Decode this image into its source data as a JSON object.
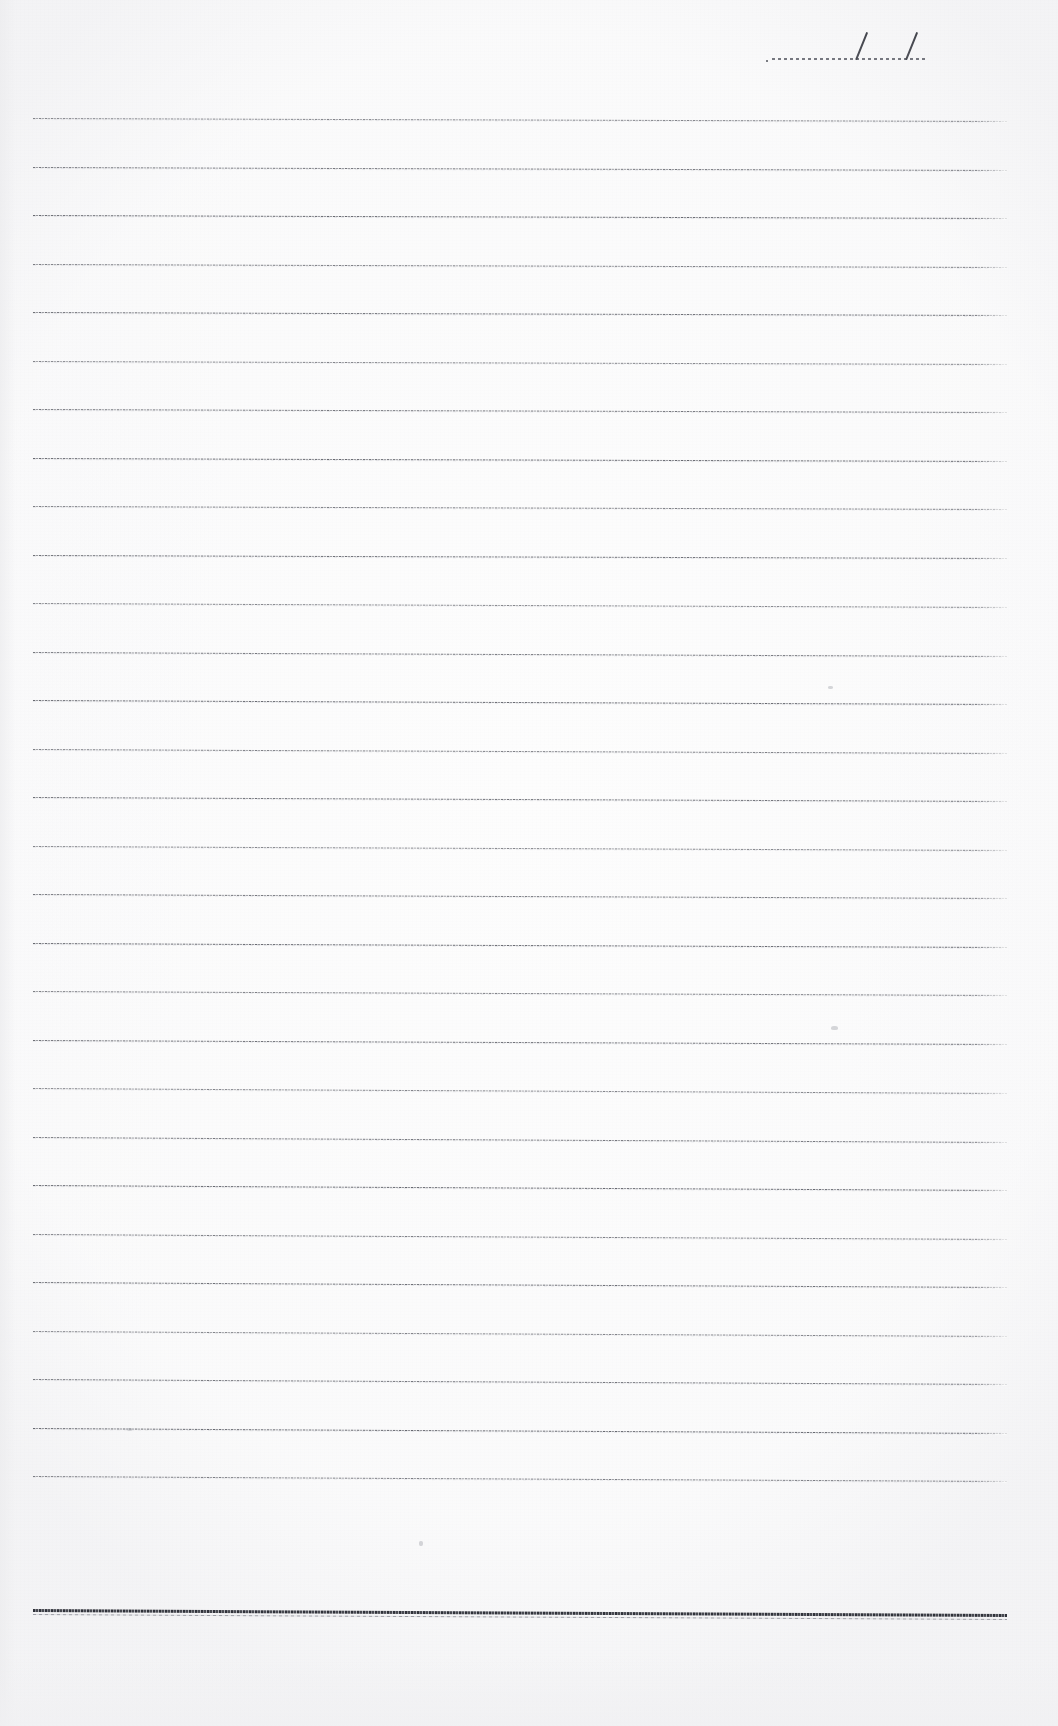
{
  "document": {
    "kind": "scanned-lined-notebook-page",
    "page_width": 1058,
    "page_height": 1726,
    "background_color": "#fdfdfd",
    "ink_color": "#46484f",
    "body_text": "",
    "note": ""
  },
  "date_field": {
    "label": "",
    "value": "",
    "separators": [
      "/",
      "/"
    ],
    "line_left": 772,
    "line_right": 926,
    "line_top": 58,
    "slash_positions": [
      855,
      905
    ]
  },
  "ruled_area": {
    "line_left": 33,
    "line_right": 1007,
    "first_line_y": 118,
    "line_spacing": 48.5,
    "line_count": 29,
    "line_ys": [
      118,
      166.5,
      215,
      263.5,
      312,
      360.5,
      409,
      457.5,
      506,
      554.5,
      603,
      651.5,
      700,
      748.5,
      797,
      845.5,
      894,
      942.5,
      991,
      1039.5,
      1088,
      1136.5,
      1185,
      1233.5,
      1282,
      1330.5,
      1379,
      1427.5,
      1476
    ],
    "line_slopes_px": [
      3,
      3,
      3,
      3,
      3,
      3,
      3,
      3,
      3,
      3,
      4,
      4,
      4,
      4,
      4,
      4,
      4,
      4,
      4,
      4,
      5,
      5,
      5,
      5,
      5,
      5,
      5,
      5,
      5
    ],
    "writing_content": []
  },
  "bottom_rule": {
    "y": 1609,
    "left": 33,
    "right": 1007,
    "thickness": 3,
    "style": "heavy-double",
    "color": "#24262e"
  },
  "specks": [
    {
      "x": 828,
      "y": 686,
      "w": 5,
      "h": 3
    },
    {
      "x": 831,
      "y": 1026,
      "w": 7,
      "h": 4
    },
    {
      "x": 127,
      "y": 1428,
      "w": 5,
      "h": 3
    },
    {
      "x": 419,
      "y": 1541,
      "w": 4,
      "h": 5
    }
  ]
}
